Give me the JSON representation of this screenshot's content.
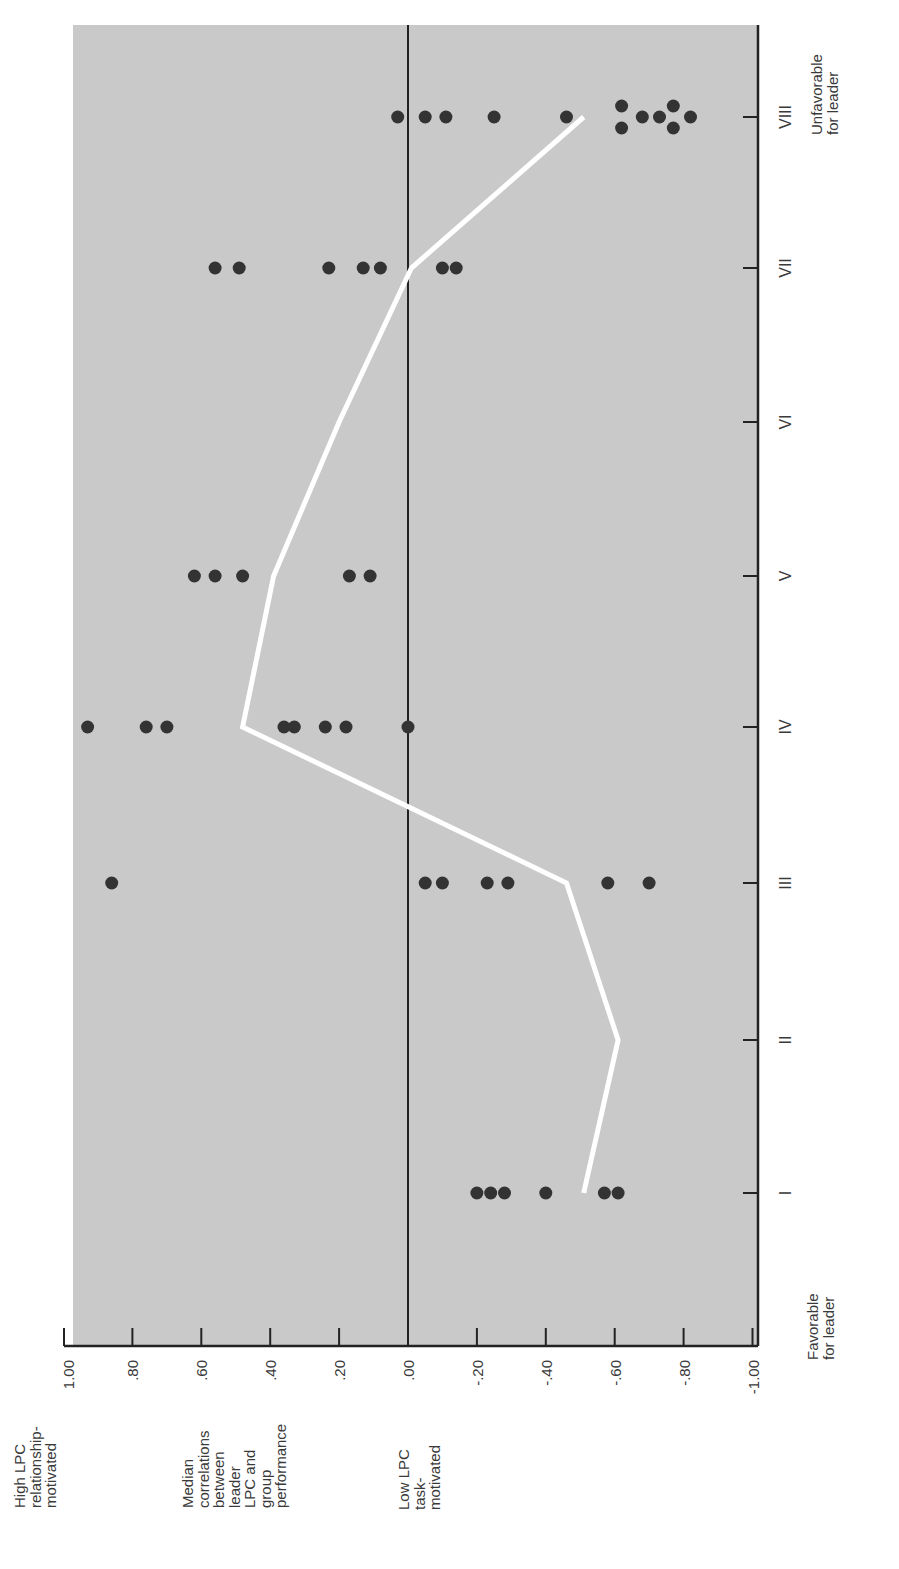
{
  "chart_data": {
    "type": "scatter",
    "title": "",
    "orientation": "rotated-90 (octants run vertically from I at bottom to VIII at top; correlation axis runs horizontally, +1.00 at left, -1.00 at right)",
    "xlabel": "Situational favorableness octants",
    "ylabel": "Median correlations between leader LPC and group performance",
    "categories": [
      "I",
      "II",
      "III",
      "IV",
      "V",
      "VI",
      "VII",
      "VIII"
    ],
    "x_ends": {
      "favorable": "Favorable for leader",
      "unfavorable": "Unfavorable for leader"
    },
    "y_ends": {
      "top": "High LPC relationship-motivated",
      "bottom": "Low LPC task-motivated"
    },
    "yticks": [
      "1.00",
      ".80",
      ".60",
      ".40",
      ".20",
      ".00",
      "-.20",
      "-.40",
      "-.60",
      "-.80",
      "-1.00"
    ],
    "ylim": [
      -1.0,
      1.0
    ],
    "grid": false,
    "zero_line": true,
    "series": [
      {
        "name": "Study correlations",
        "kind": "points",
        "points": {
          "I": [
            -0.2,
            -0.24,
            -0.28,
            -0.4,
            -0.57,
            -0.61
          ],
          "II": [],
          "III": [
            0.86,
            -0.05,
            -0.1,
            -0.23,
            -0.29,
            -0.58,
            -0.7
          ],
          "IV": [
            0.93,
            0.76,
            0.7,
            0.36,
            0.33,
            0.24,
            0.18,
            0.0
          ],
          "V": [
            0.62,
            0.56,
            0.48,
            0.17,
            0.11
          ],
          "VI": [],
          "VII": [
            0.56,
            0.49,
            0.23,
            0.13,
            0.08,
            -0.1,
            -0.14
          ],
          "VIII": [
            0.03,
            -0.05,
            -0.11,
            -0.25,
            -0.46,
            -0.62,
            -0.62,
            -0.68,
            -0.73,
            -0.77,
            -0.77,
            -0.82
          ]
        }
      },
      {
        "name": "Median correlation",
        "kind": "line",
        "values": [
          -0.51,
          -0.61,
          -0.46,
          0.48,
          0.39,
          0.2,
          -0.01,
          -0.51
        ]
      }
    ],
    "colors": {
      "background": "#c9c9c9",
      "points": "#333333",
      "median_line": "#ffffff",
      "axis": "#222222"
    }
  },
  "labels": {
    "top_left": [
      "High LPC",
      "relationship-",
      "motivated"
    ],
    "middle_left": [
      "Median",
      "correlations",
      "between",
      "leader",
      "LPC and",
      "group",
      "performance"
    ],
    "bottom_left": [
      "Low LPC",
      "task-",
      "motivated"
    ],
    "favorable": [
      "Favorable",
      "for leader"
    ],
    "unfavorable": [
      "Unfavorable",
      "for leader"
    ]
  }
}
